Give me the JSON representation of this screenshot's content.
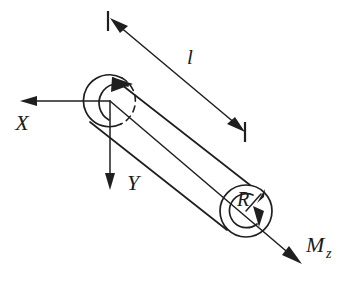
{
  "figure": {
    "type": "engineering-diagram",
    "background_color": "#ffffff",
    "line_color": "#1f1f1f",
    "width": 344,
    "height": 287
  },
  "labels": {
    "length": "l",
    "axis_x": "X",
    "axis_y": "Y",
    "radius": "R",
    "moment": "M",
    "moment_subscript": "z"
  },
  "geometry": {
    "left_end": {
      "name": "left-end-circle",
      "center_x": 109,
      "center_y": 101,
      "radius": 26,
      "dashed_arc": "lower-right"
    },
    "right_end": {
      "name": "right-end-circle",
      "center_x": 246,
      "center_y": 211,
      "radius": 26
    },
    "origin": {
      "x": 110,
      "y": 101
    },
    "axis_x_tip": {
      "x": 22,
      "y": 101
    },
    "axis_y_tip": {
      "x": 110,
      "y": 189
    },
    "moment_axis_tip": {
      "x": 301,
      "y": 263
    },
    "dimension_line": {
      "start": {
        "x": 112,
        "y": 22
      },
      "end": {
        "x": 243,
        "y": 128
      }
    }
  },
  "annotations": {
    "length_dimension": "double-headed dimension arrow spanning shaft length",
    "left_torque_arc": "curved arrow indicating torsional rotation at fixed end",
    "right_torque_arc": "curved arrow indicating applied moment at free end",
    "radius_arrow": "radius arrow from center to circumference"
  }
}
